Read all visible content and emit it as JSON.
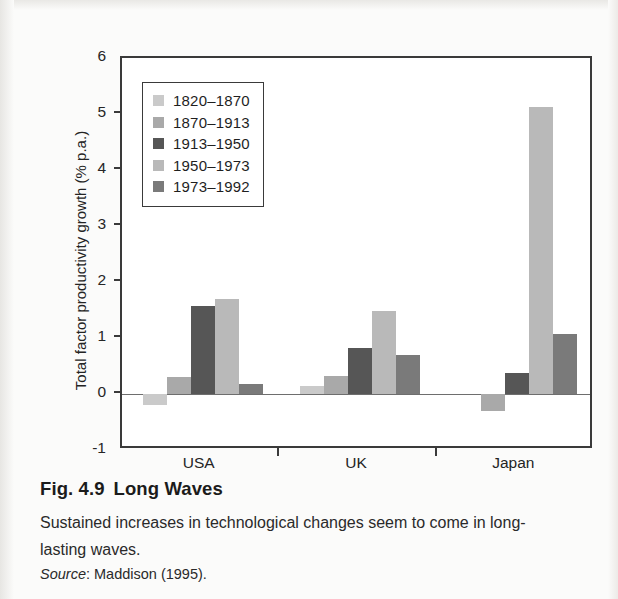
{
  "chart_data": {
    "type": "bar",
    "title": "",
    "xlabel": "",
    "ylabel": "Total factor productivity growth (% p.a.)",
    "categories": [
      "USA",
      "UK",
      "Japan"
    ],
    "ylim": [
      -1,
      6
    ],
    "yticks": [
      -1,
      0,
      1,
      2,
      3,
      4,
      5,
      6
    ],
    "ytick_labels": [
      "-1",
      "0",
      "1",
      "2",
      "3",
      "4",
      "5",
      "6"
    ],
    "grid": false,
    "legend_position": "top-left-inside",
    "series": [
      {
        "name": "1820-1870",
        "label": "1820–1870",
        "color": "#cacaca",
        "values": [
          -0.2,
          0.15,
          0
        ]
      },
      {
        "name": "1870-1913",
        "label": "1870–1913",
        "color": "#a9a9a9",
        "values": [
          0.3,
          0.32,
          -0.3
        ]
      },
      {
        "name": "1913-1950",
        "label": "1913–1950",
        "color": "#565656",
        "values": [
          1.58,
          0.82,
          0.38
        ]
      },
      {
        "name": "1950-1973",
        "label": "1950–1973",
        "color": "#b9b9b9",
        "values": [
          1.7,
          1.48,
          5.12
        ]
      },
      {
        "name": "1973-1992",
        "label": "1973–1992",
        "color": "#7a7a7a",
        "values": [
          0.17,
          0.7,
          1.08
        ]
      }
    ]
  },
  "caption": {
    "figure_number": "Fig. 4.9",
    "figure_title": "Long Waves",
    "body": "Sustained increases in technological changes seem to come in long-lasting waves.",
    "source_label": "Source",
    "source_text": ": Maddison (1995)."
  },
  "colors": {
    "axis": "#3a3a3a",
    "text": "#242424",
    "page_background": "#fbfbfa",
    "plot_background": "#ffffff"
  }
}
